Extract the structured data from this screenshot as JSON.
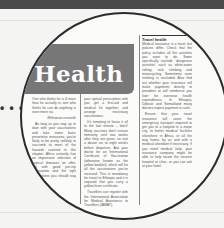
{
  "view": {
    "type": "magnified-newspaper-clipping",
    "pointer_dots": "• • •"
  },
  "article": {
    "section_title": "Health",
    "sidebar_heading": "Travel health",
    "intro_quote": "One who thinks he is ill more than he actually is; one who thinks he can do anything is even more so.",
    "intro_credit": "(Ethiopian proverb)",
    "left_column": [
      "As long as you stay up to date with your vaccinations and take some basic preventive measures, you're likely to be pretty unlikely to succumb to most of the hazards covered in this chapter. Africa certainly has an impressive selection of tropical diseases on offer, but with good pre-trip preparation and the right precautions you should stay healthy."
    ],
    "middle_column": [
      "your optical prescription with you; get a first-aid and medical kit together; and arrange necessary vaccinations.",
      "It's tempting to leave it all to the last minute – don't! Many vaccines don't ensure immunity until two weeks after they are given, so visit a doctor six to eight weeks before departure. Ask your doctor for an International Certificate of Vaccination (otherwise known as the yellow booklet), which will list all the vaccinations you've received. This is mandatory for travel to Ethiopia and it is required that you carry a yellow fever certificate.",
      "Travellers can register with the International Association for Medical Assistance to Travellers (IAMAT)."
    ],
    "right_column": [
      "Medical insurance is a must, but policies differ. Check that the policy includes all the activities you want to do. Some specifically exclude 'dangerous activities' such as white-water rafting, rock climbing and motorcycling. Sometimes even trekking is excluded. Also find out whether your insurance will make payments directly to providers or will reimburse you later for overseas health expenditures. In Ethiopia, Djibouti and Somaliland many doctors expect payment in cash.",
      "Ensure that your travel insurance will cover the emergency transport required to get you to a hospital in a major city, to better medical facilities elsewhere in Africa, or all the way home, by air and with a medical attendant if necessary. If you need medical help, your insurance company might be able to help locate the nearest hospital or clinic, or you can ask at your hotel."
    ]
  }
}
